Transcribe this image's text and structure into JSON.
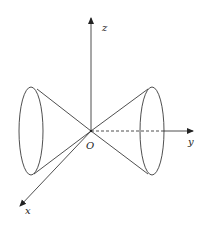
{
  "diagram": {
    "type": "3d-axes-double-cone",
    "labels": {
      "z": "z",
      "y": "y",
      "x": "x",
      "origin": "O"
    },
    "colors": {
      "stroke": "#222222",
      "background": "#ffffff"
    }
  }
}
